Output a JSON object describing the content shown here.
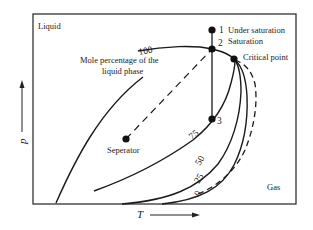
{
  "diagram": {
    "type": "phase-diagram",
    "region_labels": {
      "liquid": "Liquid",
      "gas": "Gas"
    },
    "annotation": {
      "line1": "Mole percentage of the",
      "line2": "liquid phase"
    },
    "points": [
      {
        "id": "1",
        "label": "Under saturation"
      },
      {
        "id": "2",
        "label": "Saturation"
      },
      {
        "id": "3",
        "label": ""
      },
      {
        "id": "critical",
        "label": "Critical point"
      },
      {
        "id": "separator",
        "label": "Seperator"
      }
    ],
    "curve_labels": [
      "100",
      "75",
      "50",
      "25",
      "0"
    ],
    "axes": {
      "x": "T",
      "y": "p"
    },
    "colors": {
      "line": "#1a1a1a",
      "frame": "#333333",
      "background": "#ffffff"
    }
  }
}
